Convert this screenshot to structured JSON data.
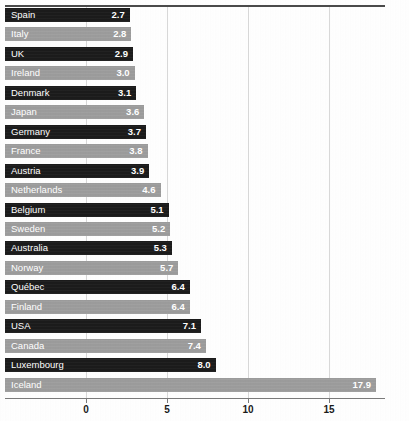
{
  "chart_data": {
    "type": "bar",
    "orientation": "horizontal",
    "title": "",
    "xlabel": "",
    "ylabel": "",
    "xlim": [
      0,
      18.5
    ],
    "grid": true,
    "legend": "none",
    "xticks": [
      "0",
      "5",
      "10",
      "15"
    ],
    "xtick_values": [
      0,
      5,
      10,
      15
    ],
    "categories": [
      "Spain",
      "Italy",
      "UK",
      "Ireland",
      "Denmark",
      "Japan",
      "Germany",
      "France",
      "Austria",
      "Netherlands",
      "Belgium",
      "Sweden",
      "Australia",
      "Norway",
      "Québec",
      "Finland",
      "USA",
      "Canada",
      "Luxembourg",
      "Iceland"
    ],
    "values": [
      2.7,
      2.8,
      2.9,
      3.0,
      3.1,
      3.6,
      3.7,
      3.8,
      3.9,
      4.6,
      5.1,
      5.2,
      5.3,
      5.7,
      6.4,
      6.4,
      7.1,
      7.4,
      8.0,
      17.9
    ],
    "value_labels": [
      "2.7",
      "2.8",
      "2.9",
      "3.0",
      "3.1",
      "3.6",
      "3.7",
      "3.8",
      "3.9",
      "4.6",
      "5.1",
      "5.2",
      "5.3",
      "5.7",
      "6.4",
      "6.4",
      "7.1",
      "7.4",
      "8.0",
      "17.9"
    ],
    "bar_styles": [
      "dark",
      "light",
      "dark",
      "light",
      "dark",
      "light",
      "dark",
      "light",
      "dark",
      "light",
      "dark",
      "light",
      "dark",
      "light",
      "dark",
      "light",
      "dark",
      "light",
      "dark",
      "light"
    ],
    "colors": {
      "dark_bar": "#1b1b1b",
      "light_bar": "#9d9d9d",
      "label_text": "#ffffff",
      "axis": "#7a7a7a",
      "gridline": "#d8d8d8",
      "top_rule": "#4a4a4a",
      "background": "#fefefe",
      "tick_text": "#1a1a1a"
    }
  }
}
